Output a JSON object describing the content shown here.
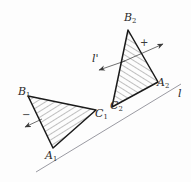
{
  "figure": {
    "background_color": "#fdfdfd",
    "stroke_color": "#1a1a1a",
    "hatch_color": "#4a4a4a",
    "axis_color": "#8f8f96"
  },
  "labels": {
    "b1": {
      "base": "B",
      "sub": "1",
      "x": 18,
      "y": 86
    },
    "a1": {
      "base": "A",
      "sub": "1",
      "x": 45,
      "y": 150
    },
    "c1": {
      "base": "C",
      "sub": "1",
      "x": 95,
      "y": 108
    },
    "b2": {
      "base": "B",
      "sub": "2",
      "x": 124,
      "y": 12
    },
    "a2": {
      "base": "A",
      "sub": "2",
      "x": 157,
      "y": 77
    },
    "c2": {
      "base": "C",
      "sub": "2",
      "x": 110,
      "y": 100
    },
    "l": {
      "base": "l",
      "sub": "",
      "x": 178,
      "y": 88
    },
    "l_prime": {
      "base": "l'",
      "sub": "",
      "x": 92,
      "y": 53
    }
  },
  "signs": {
    "plus_right": {
      "text": "+",
      "x": 140,
      "y": 38
    },
    "minus_left": {
      "text": "−",
      "x": 22,
      "y": 110
    }
  },
  "geometry": {
    "triangle_left": {
      "points": "28,96 96,110 53,148",
      "label": "triangle A1 B1 C1"
    },
    "triangle_right": {
      "points": "128,30 158,82 112,107",
      "label": "triangle A2 B2 C2"
    },
    "line_l": {
      "from": "36,172",
      "to": "181,84"
    },
    "line_l_prime": {
      "from": "99,68",
      "to": "163,44"
    }
  },
  "arrows": {
    "l_prime_left": {
      "tip": "99,68",
      "label": "arrow pointing down-left along l-prime"
    },
    "l_prime_right": {
      "tip": "163,44",
      "label": "arrow pointing up-right along l-prime"
    },
    "left_triangle_normal": {
      "tip": "24,126",
      "label": "arrow pointing down-left from left triangle"
    }
  }
}
